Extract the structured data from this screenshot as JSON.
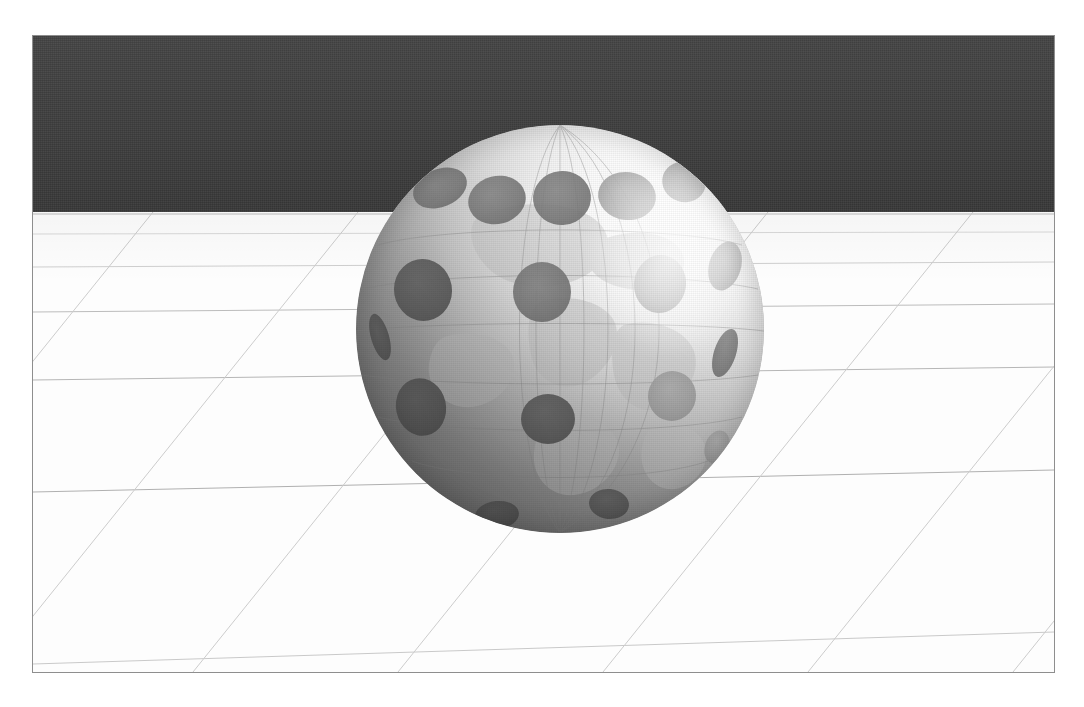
{
  "scene": {
    "title": "Dimpled globe on perspective grid floor",
    "subject": "sphere-globe-with-dimples",
    "lighting": "key light from upper right",
    "colors": {
      "page_background": "#ffffff",
      "frame_border": "#8e8e8e",
      "sky": "#3b3b3b",
      "ground": "#fdfdfd",
      "grid_line": "#b9b9b9",
      "grid_line_faint": "#d6d6d6",
      "shadow": "#5a5a5a",
      "globe_lit": "#ffffff",
      "globe_mid": "#c2c2c2",
      "globe_dark": "#777777",
      "dimple": "#8d8d8d",
      "dimple_dark": "#6e6e6e",
      "graticule": "#9a9a9a",
      "landmass": "#d3d3d3"
    },
    "frame": {
      "x": 32,
      "y": 35,
      "width": 1023,
      "height": 638
    },
    "horizon_y": 211
  },
  "sky": {
    "label": "dark backdrop wall",
    "height_px": 176
  },
  "ground": {
    "label": "white grid floor",
    "horizontal_lines_y": [
      54,
      78,
      112,
      160,
      232,
      342,
      470
    ],
    "diagonal_spacing_px": 205,
    "vanishing_point_x": 560
  },
  "globe": {
    "label": "dimpled world globe",
    "center_x": 527,
    "center_y": 293,
    "radius": 204,
    "dimple_count": 17,
    "dimples": [
      {
        "cx": 0.205,
        "cy": 0.155,
        "rx": 0.068,
        "ry": 0.047,
        "rot": -22,
        "tone": "dark"
      },
      {
        "cx": 0.345,
        "cy": 0.185,
        "rx": 0.072,
        "ry": 0.06,
        "rot": -14,
        "tone": "dark"
      },
      {
        "cx": 0.505,
        "cy": 0.18,
        "rx": 0.07,
        "ry": 0.065,
        "rot": -6,
        "tone": "dark"
      },
      {
        "cx": 0.665,
        "cy": 0.175,
        "rx": 0.07,
        "ry": 0.058,
        "rot": 8,
        "tone": "mid"
      },
      {
        "cx": 0.805,
        "cy": 0.14,
        "rx": 0.055,
        "ry": 0.05,
        "rot": 18,
        "tone": "mid"
      },
      {
        "cx": 0.165,
        "cy": 0.405,
        "rx": 0.07,
        "ry": 0.077,
        "rot": -10,
        "tone": "darker"
      },
      {
        "cx": 0.455,
        "cy": 0.41,
        "rx": 0.072,
        "ry": 0.073,
        "rot": 0,
        "tone": "dark"
      },
      {
        "cx": 0.745,
        "cy": 0.39,
        "rx": 0.064,
        "ry": 0.07,
        "rot": 8,
        "tone": "mid"
      },
      {
        "cx": 0.905,
        "cy": 0.345,
        "rx": 0.04,
        "ry": 0.062,
        "rot": 16,
        "tone": "mid"
      },
      {
        "cx": 0.16,
        "cy": 0.69,
        "rx": 0.06,
        "ry": 0.072,
        "rot": -12,
        "tone": "darker"
      },
      {
        "cx": 0.47,
        "cy": 0.72,
        "rx": 0.067,
        "ry": 0.062,
        "rot": 0,
        "tone": "darker"
      },
      {
        "cx": 0.775,
        "cy": 0.665,
        "rx": 0.058,
        "ry": 0.06,
        "rot": 10,
        "tone": "mid"
      },
      {
        "cx": 0.905,
        "cy": 0.56,
        "rx": 0.028,
        "ry": 0.06,
        "rot": 18,
        "tone": "dark"
      },
      {
        "cx": 0.345,
        "cy": 0.955,
        "rx": 0.055,
        "ry": 0.035,
        "rot": -6,
        "tone": "darker"
      },
      {
        "cx": 0.62,
        "cy": 0.93,
        "rx": 0.05,
        "ry": 0.038,
        "rot": 6,
        "tone": "darker"
      },
      {
        "cx": 0.06,
        "cy": 0.52,
        "rx": 0.022,
        "ry": 0.058,
        "rot": -16,
        "tone": "darker"
      },
      {
        "cx": 0.885,
        "cy": 0.79,
        "rx": 0.03,
        "ry": 0.042,
        "rot": 20,
        "tone": "mid"
      }
    ],
    "graticule": {
      "meridian_count": 7,
      "parallel_count": 6,
      "label": "latitude and longitude lines"
    }
  },
  "shadow": {
    "label": "cast shadow ellipse",
    "center_x": 261,
    "center_y": 576,
    "width": 310,
    "height": 165
  }
}
